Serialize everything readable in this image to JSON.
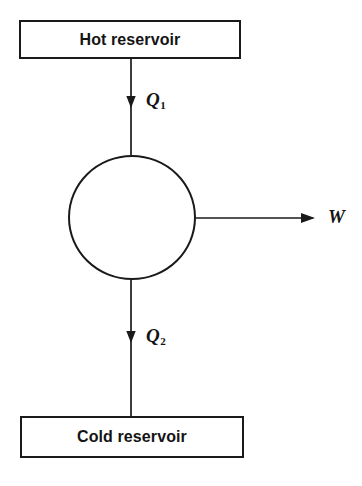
{
  "diagram": {
    "background_color": "#ffffff",
    "line_color": "#1a1a1a",
    "text_color": "#141414",
    "hot_reservoir": {
      "label": "Hot reservoir"
    },
    "cold_reservoir": {
      "label": "Cold reservoir"
    },
    "engine": {
      "label": "",
      "shape": "circle"
    },
    "flows": [
      {
        "id": "heat-in",
        "symbol": "Q",
        "subscript": "1",
        "direction": "down",
        "from": "hot-reservoir",
        "to": "engine"
      },
      {
        "id": "heat-out",
        "symbol": "Q",
        "subscript": "2",
        "direction": "down",
        "from": "engine",
        "to": "cold-reservoir"
      },
      {
        "id": "work-out",
        "symbol": "W",
        "subscript": "",
        "direction": "right",
        "from": "engine",
        "to": "surroundings"
      }
    ]
  }
}
